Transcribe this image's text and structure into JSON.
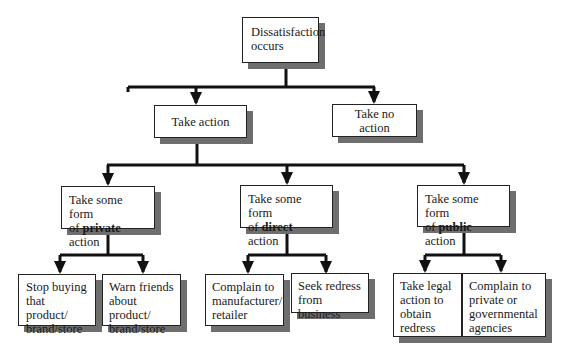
{
  "root": {
    "label": "Dissatisfaction occurs",
    "line1": "Dissatisfaction",
    "line2": "occurs"
  },
  "level2": {
    "take_action": "Take action",
    "take_no_action": "Take no action"
  },
  "level3": [
    {
      "prefix": "Take some form",
      "of": "of ",
      "bold": "private",
      "suffix": " action"
    },
    {
      "prefix": "Take some form",
      "of": "of ",
      "bold": "direct",
      "suffix": " action"
    },
    {
      "prefix": "Take some form",
      "of": "of ",
      "bold": "public",
      "suffix": " action"
    }
  ],
  "leaves": {
    "private": [
      {
        "lines": [
          "Stop buying",
          "that product/",
          "brand/store"
        ]
      },
      {
        "lines": [
          "Warn friends",
          "about product/",
          "brand/store"
        ]
      }
    ],
    "direct": [
      {
        "lines": [
          "Complain to",
          "manufacturer/",
          "retailer"
        ]
      },
      {
        "lines": [
          "Seek redress",
          "from business"
        ]
      }
    ],
    "public": [
      {
        "lines": [
          "Take legal",
          "action to",
          "obtain",
          "redress"
        ]
      },
      {
        "lines": [
          "Complain to",
          "private or",
          "governmental",
          "agencies"
        ]
      }
    ]
  },
  "colors": {
    "line": "#111111",
    "shadow": "#6e6e6e",
    "box_bg": "#ffffff"
  }
}
